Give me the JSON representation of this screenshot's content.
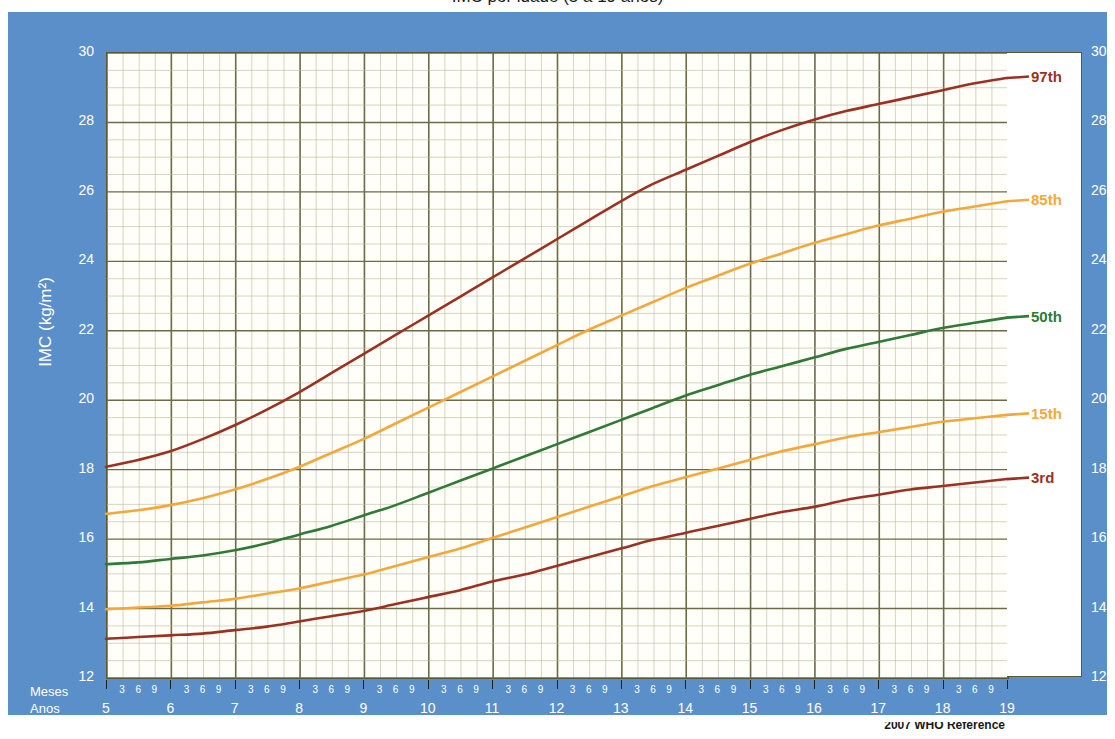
{
  "title": "IMC por idade (5 a 19 anos)",
  "footer_note": "2007 WHO Reference",
  "axes": {
    "y_title": "IMC (kg/m²)",
    "x_title": "Idade (meses completos e anos)",
    "months_row_label": "Meses",
    "years_row_label": "Anos",
    "y_ticks": [
      12,
      14,
      16,
      18,
      20,
      22,
      24,
      26,
      28,
      30
    ],
    "month_subticks": [
      "3",
      "6",
      "9"
    ],
    "year_ticks": [
      5,
      6,
      7,
      8,
      9,
      10,
      11,
      12,
      13,
      14,
      15,
      16,
      17,
      18,
      19
    ]
  },
  "colors": {
    "panel_blue": "#5b8fc9",
    "plot_bg": "#fffef8",
    "grid_major": "#6b6b45",
    "grid_minor": "#b9b9a4",
    "p97": "#9b3221",
    "p85": "#f2a83b",
    "p50": "#2f7a35",
    "p15": "#f2a83b",
    "p3": "#9b3221",
    "axis_text": "#ffffff"
  },
  "chart_data": {
    "type": "line",
    "title": "IMC por idade (5 a 19 anos)",
    "xlabel": "Idade (meses completos e anos)",
    "ylabel": "IMC (kg/m²)",
    "xlim": [
      5,
      19
    ],
    "ylim": [
      12,
      30
    ],
    "grid": true,
    "legend": "right-of-curve-ends",
    "x": [
      5,
      5.5,
      6,
      6.5,
      7,
      7.5,
      8,
      8.5,
      9,
      9.5,
      10,
      10.5,
      11,
      11.5,
      12,
      12.5,
      13,
      13.5,
      14,
      14.5,
      15,
      15.5,
      16,
      16.5,
      17,
      17.5,
      18,
      18.5,
      19
    ],
    "series": [
      {
        "name": "97th",
        "color": "#9b3221",
        "label": "97th",
        "values": [
          18.05,
          18.25,
          18.5,
          18.85,
          19.25,
          19.7,
          20.2,
          20.75,
          21.3,
          21.85,
          22.4,
          22.95,
          23.5,
          24.05,
          24.6,
          25.15,
          25.7,
          26.2,
          26.6,
          27.0,
          27.4,
          27.75,
          28.05,
          28.3,
          28.5,
          28.7,
          28.9,
          29.1,
          29.25
        ]
      },
      {
        "name": "85th",
        "color": "#f2a83b",
        "label": "85th",
        "values": [
          16.7,
          16.8,
          16.95,
          17.15,
          17.4,
          17.7,
          18.05,
          18.45,
          18.85,
          19.3,
          19.75,
          20.2,
          20.65,
          21.1,
          21.55,
          22.0,
          22.4,
          22.8,
          23.2,
          23.55,
          23.9,
          24.2,
          24.5,
          24.75,
          25.0,
          25.2,
          25.4,
          25.55,
          25.7
        ]
      },
      {
        "name": "50th",
        "color": "#2f7a35",
        "label": "50th",
        "values": [
          15.25,
          15.3,
          15.4,
          15.5,
          15.65,
          15.85,
          16.1,
          16.35,
          16.65,
          16.95,
          17.3,
          17.65,
          18.0,
          18.35,
          18.7,
          19.05,
          19.4,
          19.75,
          20.1,
          20.4,
          20.7,
          20.95,
          21.2,
          21.45,
          21.65,
          21.85,
          22.05,
          22.2,
          22.35
        ]
      },
      {
        "name": "15th",
        "color": "#f2a83b",
        "label": "15th",
        "values": [
          13.95,
          14.0,
          14.05,
          14.15,
          14.25,
          14.4,
          14.55,
          14.75,
          14.95,
          15.2,
          15.45,
          15.7,
          16.0,
          16.3,
          16.6,
          16.9,
          17.2,
          17.5,
          17.75,
          18.0,
          18.25,
          18.5,
          18.7,
          18.9,
          19.05,
          19.2,
          19.35,
          19.45,
          19.55
        ]
      },
      {
        "name": "3rd",
        "color": "#9b3221",
        "label": "3rd",
        "values": [
          13.1,
          13.15,
          13.2,
          13.25,
          13.35,
          13.45,
          13.6,
          13.75,
          13.9,
          14.1,
          14.3,
          14.5,
          14.75,
          14.95,
          15.2,
          15.45,
          15.7,
          15.95,
          16.15,
          16.35,
          16.55,
          16.75,
          16.9,
          17.1,
          17.25,
          17.4,
          17.5,
          17.6,
          17.7
        ]
      }
    ]
  }
}
